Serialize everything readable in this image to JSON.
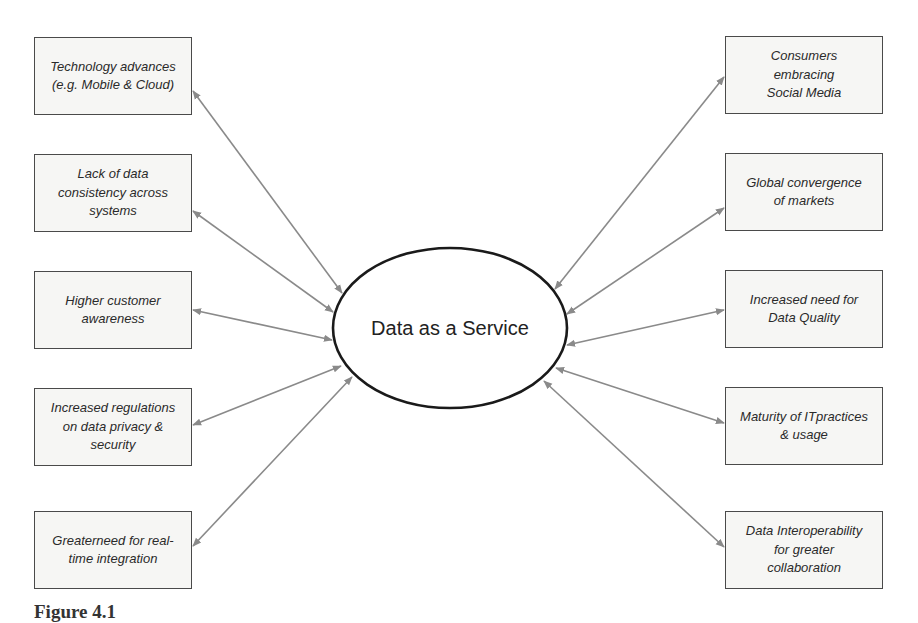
{
  "diagram": {
    "center": {
      "label": "Data as a Service",
      "shape": "ellipse",
      "cx": 450,
      "cy": 328,
      "rx": 117,
      "ry": 80
    },
    "left_drivers": [
      {
        "label": "Technology advances\n(e.g. Mobile & Cloud)"
      },
      {
        "label": "Lack of data\nconsistency across\nsystems"
      },
      {
        "label": "Higher customer\nawareness"
      },
      {
        "label": "Increased regulations\non data privacy &\nsecurity"
      },
      {
        "label": "Greaterneed for real-\ntime integration"
      }
    ],
    "right_drivers": [
      {
        "label": "Consumers\nembracing\nSocial Media"
      },
      {
        "label": "Global convergence\nof markets"
      },
      {
        "label": "Increased need for\nData Quality"
      },
      {
        "label": "Maturity of ITpractices\n& usage"
      },
      {
        "label": "Data Interoperability\nfor greater\ncollaboration"
      }
    ],
    "connector": {
      "type": "bidirectional-arrow"
    },
    "colors": {
      "box_fill": "#f6f6f4",
      "box_border": "#4a4a4a",
      "arrow": "#8a8a8a",
      "ellipse_stroke": "#1a1a1a"
    }
  },
  "caption": {
    "figure_label": "Figure 4.1"
  }
}
